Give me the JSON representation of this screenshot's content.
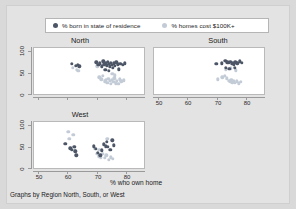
{
  "figure": {
    "background_color": "#d9d9d9",
    "panel_background_color": "#ffffff",
    "footnote": "Graphs by Region North, South, or West",
    "xaxis_title": "% who own home"
  },
  "legend": {
    "items": [
      {
        "label": "% born in state of residence",
        "color": "#4d5666",
        "marker": "filled-circle"
      },
      {
        "label": "% homes cost $100K+",
        "color": "#c3ccd6",
        "marker": "filled-circle"
      }
    ]
  },
  "chart_data": {
    "type": "scatter",
    "title": "",
    "xlabel": "% who own home",
    "ylabel": "",
    "xlim": [
      45,
      83
    ],
    "ylim": [
      0,
      110
    ],
    "xticks": [
      50,
      60,
      70,
      80
    ],
    "yticks": [
      0,
      50,
      100
    ],
    "grid": false,
    "legend_position": "top",
    "facet_label": "Graphs by Region North, South, or West",
    "panels": [
      {
        "name": "North",
        "title": "North",
        "show_xticklabels": false,
        "series": [
          {
            "name": "% born in state of residence",
            "color": "#4d5666",
            "points": [
              [
                58.0,
                72.0
              ],
              [
                59.4,
                68.0
              ],
              [
                60.2,
                70.0
              ],
              [
                60.6,
                66.0
              ],
              [
                66.5,
                76.0
              ],
              [
                67.2,
                70.0
              ],
              [
                67.8,
                73.0
              ],
              [
                68.4,
                66.0
              ],
              [
                68.9,
                78.0
              ],
              [
                69.3,
                71.0
              ],
              [
                69.8,
                74.0
              ],
              [
                70.1,
                69.0
              ],
              [
                70.5,
                77.0
              ],
              [
                70.9,
                72.0
              ],
              [
                71.2,
                66.0
              ],
              [
                71.6,
                75.0
              ],
              [
                71.9,
                70.0
              ],
              [
                72.3,
                62.0
              ],
              [
                72.6,
                73.0
              ],
              [
                73.0,
                68.0
              ],
              [
                73.4,
                76.0
              ],
              [
                73.9,
                71.0
              ],
              [
                74.3,
                59.0
              ],
              [
                74.8,
                72.0
              ],
              [
                75.6,
                70.0
              ],
              [
                76.4,
                73.0
              ],
              [
                69.6,
                58.0
              ],
              [
                70.8,
                55.0
              ]
            ]
          },
          {
            "name": "% homes cost $100K+",
            "color": "#c3ccd6",
            "points": [
              [
                58.3,
                62.0
              ],
              [
                59.8,
                58.0
              ],
              [
                60.3,
                55.0
              ],
              [
                66.8,
                66.0
              ],
              [
                67.5,
                40.0
              ],
              [
                68.2,
                35.0
              ],
              [
                68.8,
                44.0
              ],
              [
                69.4,
                30.0
              ],
              [
                69.9,
                33.0
              ],
              [
                70.3,
                27.0
              ],
              [
                70.7,
                36.0
              ],
              [
                71.1,
                31.0
              ],
              [
                71.5,
                25.0
              ],
              [
                71.9,
                34.0
              ],
              [
                72.4,
                29.0
              ],
              [
                72.8,
                38.0
              ],
              [
                73.2,
                26.0
              ],
              [
                73.7,
                32.0
              ],
              [
                74.1,
                24.0
              ],
              [
                74.6,
                35.0
              ],
              [
                75.2,
                30.0
              ],
              [
                76.0,
                33.0
              ],
              [
                73.0,
                45.0
              ],
              [
                72.0,
                48.0
              ]
            ]
          }
        ]
      },
      {
        "name": "South",
        "title": "South",
        "show_xticklabels": true,
        "series": [
          {
            "name": "% born in state of residence",
            "color": "#4d5666",
            "points": [
              [
                66.5,
                72.0
              ],
              [
                68.4,
                73.0
              ],
              [
                69.6,
                80.0
              ],
              [
                70.3,
                76.0
              ],
              [
                70.9,
                74.0
              ],
              [
                71.4,
                77.0
              ],
              [
                71.8,
                72.0
              ],
              [
                72.2,
                75.0
              ],
              [
                72.6,
                70.0
              ],
              [
                73.1,
                76.0
              ],
              [
                73.8,
                73.0
              ],
              [
                74.6,
                78.0
              ],
              [
                75.4,
                74.0
              ],
              [
                69.9,
                62.0
              ],
              [
                71.0,
                60.0
              ],
              [
                72.9,
                63.0
              ]
            ]
          },
          {
            "name": "% homes cost $100K+",
            "color": "#c3ccd6",
            "points": [
              [
                67.0,
                35.0
              ],
              [
                68.6,
                40.0
              ],
              [
                69.5,
                44.0
              ],
              [
                70.2,
                38.0
              ],
              [
                70.8,
                32.0
              ],
              [
                71.3,
                30.0
              ],
              [
                71.7,
                34.0
              ],
              [
                72.1,
                28.0
              ],
              [
                72.5,
                31.0
              ],
              [
                73.0,
                27.0
              ],
              [
                73.6,
                30.0
              ],
              [
                74.3,
                26.0
              ],
              [
                75.0,
                29.0
              ],
              [
                69.8,
                58.0
              ],
              [
                71.6,
                61.0
              ],
              [
                73.3,
                57.0
              ]
            ]
          }
        ]
      },
      {
        "name": "West",
        "title": "West",
        "show_xticklabels": true,
        "series": [
          {
            "name": "% born in state of residence",
            "color": "#4d5666",
            "points": [
              [
                55.8,
                58.0
              ],
              [
                57.6,
                47.0
              ],
              [
                58.0,
                44.0
              ],
              [
                58.9,
                50.0
              ],
              [
                59.3,
                40.0
              ],
              [
                59.6,
                30.0
              ],
              [
                65.6,
                52.0
              ],
              [
                66.3,
                46.0
              ],
              [
                67.0,
                36.0
              ],
              [
                68.4,
                42.0
              ],
              [
                69.2,
                57.0
              ],
              [
                69.7,
                52.0
              ],
              [
                70.1,
                62.0
              ],
              [
                70.5,
                50.0
              ],
              [
                71.3,
                44.0
              ],
              [
                72.0,
                66.0
              ],
              [
                72.5,
                54.0
              ],
              [
                67.9,
                30.0
              ]
            ]
          },
          {
            "name": "% homes cost $100K+",
            "color": "#c3ccd6",
            "points": [
              [
                56.8,
                86.0
              ],
              [
                58.6,
                80.0
              ],
              [
                57.2,
                70.0
              ],
              [
                59.1,
                42.0
              ],
              [
                65.9,
                46.0
              ],
              [
                66.8,
                34.0
              ],
              [
                67.4,
                28.0
              ],
              [
                68.0,
                26.0
              ],
              [
                68.8,
                34.0
              ],
              [
                69.4,
                24.0
              ],
              [
                70.0,
                30.0
              ],
              [
                70.8,
                20.0
              ],
              [
                71.6,
                26.0
              ],
              [
                72.3,
                22.0
              ],
              [
                70.3,
                70.0
              ],
              [
                67.6,
                44.0
              ]
            ]
          }
        ]
      }
    ]
  }
}
